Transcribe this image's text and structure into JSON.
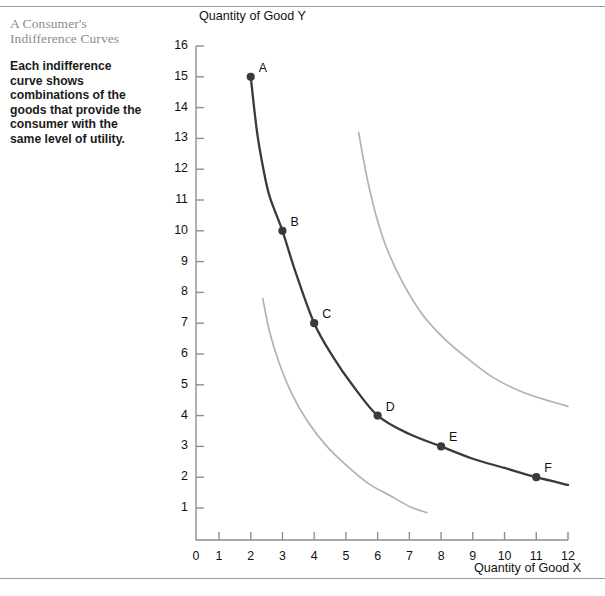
{
  "caption": {
    "title_line1": "A Consumer's",
    "title_line2": "Indifference Curves",
    "body": "Each indifference curve shows combinations of the goods that provide the consumer with the same level of utility."
  },
  "colors": {
    "main_curve": "#3a3a3a",
    "other_curves": "#b2b2b2",
    "axis": "#8f8f8f",
    "title_text": "#8c8c8c",
    "body_text": "#1b1b1b",
    "rule": "#9a9a9a"
  },
  "chart_data": {
    "type": "line",
    "title": "",
    "xlabel": "Quantity of Good X",
    "ylabel": "Quantity of Good Y",
    "xlim": [
      0,
      12
    ],
    "ylim": [
      0,
      16
    ],
    "grid": false,
    "legend": "none",
    "xticks": [
      "0",
      "1",
      "2",
      "3",
      "4",
      "5",
      "6",
      "7",
      "8",
      "9",
      "10",
      "11",
      "12"
    ],
    "yticks": [
      "1",
      "2",
      "3",
      "4",
      "5",
      "6",
      "7",
      "8",
      "9",
      "10",
      "11",
      "12",
      "13",
      "14",
      "15",
      "16"
    ],
    "series": [
      {
        "name": "indifference-curve-middle",
        "style": "solid-dark",
        "color": "#3a3a3a",
        "points": [
          {
            "label": "A",
            "x": 2,
            "y": 15
          },
          {
            "label": "B",
            "x": 3,
            "y": 10
          },
          {
            "label": "C",
            "x": 4,
            "y": 7
          },
          {
            "label": "D",
            "x": 6,
            "y": 4
          },
          {
            "label": "E",
            "x": 8,
            "y": 3
          },
          {
            "label": "F",
            "x": 11,
            "y": 2
          }
        ],
        "curve_path_xy": [
          [
            2.0,
            15.0
          ],
          [
            2.2,
            13.2
          ],
          [
            2.4,
            12.0
          ],
          [
            2.6,
            11.1
          ],
          [
            3.0,
            10.0
          ],
          [
            3.4,
            8.7
          ],
          [
            4.0,
            7.0
          ],
          [
            4.6,
            5.9
          ],
          [
            5.2,
            5.0
          ],
          [
            6.0,
            4.0
          ],
          [
            7.0,
            3.4
          ],
          [
            8.0,
            3.0
          ],
          [
            9.0,
            2.6
          ],
          [
            10.0,
            2.3
          ],
          [
            11.0,
            2.0
          ],
          [
            12.0,
            1.75
          ]
        ]
      },
      {
        "name": "indifference-curve-lower",
        "style": "solid-gray",
        "color": "#b2b2b2",
        "points": [],
        "curve_path_xy": [
          [
            2.38,
            7.8
          ],
          [
            2.6,
            6.7
          ],
          [
            2.9,
            5.7
          ],
          [
            3.3,
            4.7
          ],
          [
            3.8,
            3.8
          ],
          [
            4.4,
            3.0
          ],
          [
            5.0,
            2.4
          ],
          [
            5.7,
            1.8
          ],
          [
            6.4,
            1.4
          ],
          [
            7.0,
            1.05
          ],
          [
            7.55,
            0.85
          ]
        ]
      },
      {
        "name": "indifference-curve-upper",
        "style": "solid-gray",
        "color": "#b2b2b2",
        "points": [],
        "curve_path_xy": [
          [
            5.4,
            13.2
          ],
          [
            5.65,
            11.8
          ],
          [
            5.95,
            10.5
          ],
          [
            6.3,
            9.4
          ],
          [
            6.8,
            8.3
          ],
          [
            7.4,
            7.3
          ],
          [
            8.1,
            6.5
          ],
          [
            8.9,
            5.8
          ],
          [
            9.7,
            5.2
          ],
          [
            10.6,
            4.75
          ],
          [
            11.5,
            4.45
          ],
          [
            12.0,
            4.3
          ]
        ]
      }
    ]
  }
}
